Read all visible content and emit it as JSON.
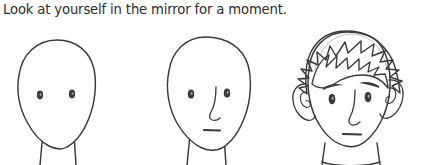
{
  "panel": {
    "background_color": "#ffffff",
    "ink_color": "#39393d",
    "caption": "Look at yourself in the mirror for a moment."
  },
  "figures": [
    {
      "id": "figure-blank",
      "name": "blank-face",
      "stage": 1,
      "description": "Empty oval head with only two eyes and a bare neck",
      "features": [
        "head-outline",
        "left-eye",
        "right-eye",
        "neck"
      ],
      "has_hair": false,
      "has_ears": false,
      "has_eyebrows": false,
      "has_nose": false,
      "has_mouth": false
    },
    {
      "id": "figure-partial",
      "name": "partial-face",
      "stage": 2,
      "description": "Oval head with eyes, nose and mouth added, still no hair or ears",
      "features": [
        "head-outline",
        "left-eye",
        "right-eye",
        "nose",
        "mouth",
        "neck"
      ],
      "has_hair": false,
      "has_ears": false,
      "has_eyebrows": false,
      "has_nose": true,
      "has_mouth": true
    },
    {
      "id": "figure-full",
      "name": "complete-face",
      "stage": 3,
      "description": "Finished face with spiky hair, ears, eyebrows, eyes, nose, mouth and collar",
      "features": [
        "spiky-hair",
        "head-outline",
        "left-ear",
        "right-ear",
        "left-eyebrow",
        "right-eyebrow",
        "left-eye",
        "right-eye",
        "nose",
        "mouth",
        "neck",
        "collar"
      ],
      "has_hair": true,
      "has_ears": true,
      "has_eyebrows": true,
      "has_nose": true,
      "has_mouth": true
    }
  ]
}
